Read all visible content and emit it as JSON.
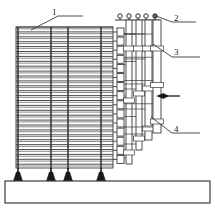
{
  "figure": {
    "type": "technical-line-diagram",
    "width": 215,
    "height": 212,
    "background_color": "#ffffff",
    "line_color": "#3a3a3a",
    "fill_color": "#ffffff",
    "foot_color": "#1a1a1a"
  },
  "callouts": [
    {
      "id": "callout-1",
      "text": "1",
      "x": 52,
      "y": 8,
      "leader": {
        "from_x": 58,
        "from_y": 16,
        "bend_x": 83,
        "bend_y": 16,
        "tip_x": 31,
        "tip_y": 30
      },
      "target": "plate-stack"
    },
    {
      "id": "callout-2",
      "text": "2",
      "x": 174,
      "y": 14,
      "leader": {
        "from_x": 172,
        "from_y": 22,
        "bend_x": 196,
        "bend_y": 22,
        "tip_x": 156,
        "tip_y": 16
      },
      "target": "terminal-circles"
    },
    {
      "id": "callout-3",
      "text": "3",
      "x": 174,
      "y": 48,
      "leader": {
        "from_x": 172,
        "from_y": 57,
        "bend_x": 200,
        "bend_y": 57,
        "tip_x": 153,
        "tip_y": 44
      },
      "target": "busbar-outer"
    },
    {
      "id": "callout-4",
      "text": "4",
      "x": 174,
      "y": 125,
      "leader": {
        "from_x": 172,
        "from_y": 133,
        "bend_x": 200,
        "bend_y": 133,
        "tip_x": 151,
        "tip_y": 117
      },
      "target": "busbar-inner"
    }
  ],
  "plate_stack": {
    "name": "plate-stack",
    "left": 16,
    "right": 113,
    "top": 27,
    "bottom": 168,
    "plate_count": 29,
    "plate_spacing": 4.9,
    "columns_x": [
      18,
      51,
      68,
      101
    ],
    "dashed_columns_x": [
      51,
      68
    ]
  },
  "base": {
    "name": "base-slab",
    "x": 5,
    "y": 181,
    "width": 205,
    "height": 22
  },
  "feet": [
    {
      "x": 18,
      "y": 168
    },
    {
      "x": 51,
      "y": 168
    },
    {
      "x": 68,
      "y": 168
    },
    {
      "x": 101,
      "y": 168
    }
  ],
  "terminals": {
    "name": "terminal-circles",
    "count": 5,
    "radius": 2.2,
    "y": 16,
    "x_positions": [
      120,
      129,
      138,
      146,
      155
    ],
    "rail": {
      "x1": 115,
      "x2": 160,
      "y": 20
    }
  },
  "connectors": {
    "name": "connector-blocks",
    "count": 16,
    "x": 117,
    "width": 7,
    "height": 8,
    "first_y": 28,
    "spacing": 9.1
  },
  "busbars": [
    {
      "name": "busbar-a",
      "x": 126,
      "width": 6,
      "y_top": 20,
      "y_bottom": 164
    },
    {
      "name": "busbar-b",
      "x": 136,
      "width": 6,
      "y_top": 20,
      "y_bottom": 150
    },
    {
      "name": "busbar-c",
      "x": 145,
      "width": 7,
      "y_top": 20,
      "y_bottom": 140
    },
    {
      "name": "busbar-d",
      "x": 153,
      "width": 8,
      "y_top": 20,
      "y_bottom": 133
    }
  ],
  "arrow": {
    "name": "direction-arrow",
    "direction": "left",
    "tip_x": 156,
    "tail_x": 180,
    "y": 96
  }
}
